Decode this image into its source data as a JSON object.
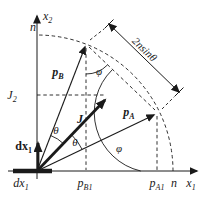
{
  "colors": {
    "ink": "#1a1a1a",
    "background": "#ffffff"
  },
  "axes": {
    "x": {
      "letter": "x",
      "sub": "1"
    },
    "y": {
      "letter": "x",
      "sub": "2"
    }
  },
  "marks": {
    "n_on_y_axis": "n",
    "n_on_x_axis": "n"
  },
  "vectors": {
    "pB": {
      "letter": "p",
      "sub": "B"
    },
    "pA": {
      "letter": "p",
      "sub": "A"
    },
    "J": {
      "letter": "J"
    },
    "dx1": {
      "letter": "dx",
      "sub": "1"
    }
  },
  "projections": {
    "J2": {
      "letter": "J",
      "sub": "2"
    },
    "pB1": {
      "letter": "p",
      "sub": "B1"
    },
    "pA1": {
      "letter": "p",
      "sub": "A1"
    },
    "dx1": {
      "letter": "dx",
      "sub": "1"
    }
  },
  "angles": {
    "theta_upper": "θ",
    "theta_lower": "θ",
    "phi_at_B": "φ",
    "phi_at_A": "φ"
  },
  "dimension": {
    "coef": "2",
    "radius": "n",
    "func": "sin",
    "angle": "θ"
  }
}
